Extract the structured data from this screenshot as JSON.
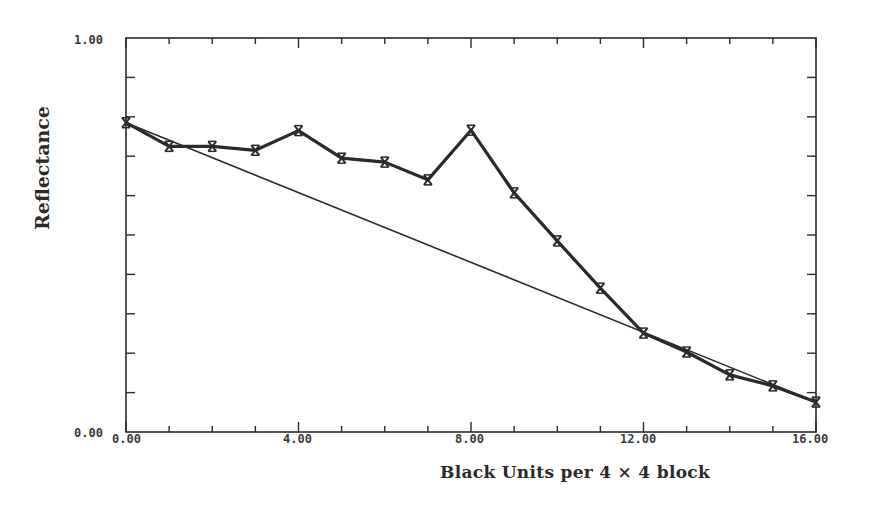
{
  "chart_data": {
    "type": "line",
    "title": "",
    "xlabel": "Black Units per 4 × 4 block",
    "ylabel": "Reflectance",
    "xlim": [
      0,
      16
    ],
    "ylim": [
      0,
      1
    ],
    "grid": false,
    "legend": null,
    "x_ticks": [
      0,
      4,
      8,
      12,
      16
    ],
    "x_tick_labels": [
      "0.00",
      "4.00",
      "8.00",
      "12.00",
      "16.00"
    ],
    "x_minor_step": 1,
    "y_ticks": [
      0,
      1
    ],
    "y_tick_labels": [
      "0.00",
      "1.00"
    ],
    "y_minor_step": 0.1,
    "series": [
      {
        "name": "measured",
        "marker": "x",
        "line_weight": "thick",
        "x": [
          0,
          1,
          2,
          3,
          4,
          5,
          6,
          7,
          8,
          9,
          10,
          11,
          12,
          13,
          14,
          15,
          16
        ],
        "values": [
          0.785,
          0.725,
          0.725,
          0.715,
          0.765,
          0.695,
          0.685,
          0.64,
          0.766,
          0.607,
          0.485,
          0.365,
          0.251,
          0.203,
          0.145,
          0.117,
          0.076
        ]
      },
      {
        "name": "linear reference",
        "marker": "none",
        "line_weight": "thin",
        "x": [
          0,
          16
        ],
        "values": [
          0.785,
          0.076
        ]
      }
    ]
  },
  "labels": {
    "ylabel": "Reflectance",
    "xlabel": "Black Units per 4 × 4 block",
    "y_top": "1.00",
    "y_bottom": "0.00",
    "x0": "0.00",
    "x4": "4.00",
    "x8": "8.00",
    "x12": "12.00",
    "x16": "16.00"
  },
  "colors": {
    "ink": "#2a2a2a",
    "background": "#ffffff"
  }
}
